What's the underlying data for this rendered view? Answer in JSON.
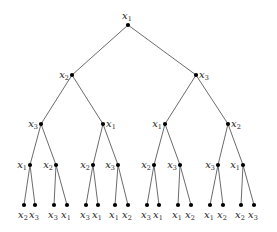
{
  "diagram": {
    "type": "tree",
    "variable_base": "x",
    "nodes": [
      {
        "id": "n0",
        "var": "1",
        "x": 128,
        "y": 25,
        "label_pos": "above"
      },
      {
        "id": "n1",
        "var": "2",
        "x": 72,
        "y": 75,
        "label_pos": "left"
      },
      {
        "id": "n2",
        "var": "3",
        "x": 196,
        "y": 75,
        "label_pos": "right"
      },
      {
        "id": "n3",
        "var": "3",
        "x": 41,
        "y": 124,
        "label_pos": "left"
      },
      {
        "id": "n4",
        "var": "1",
        "x": 103,
        "y": 124,
        "label_pos": "right"
      },
      {
        "id": "n5",
        "var": "1",
        "x": 165,
        "y": 124,
        "label_pos": "left"
      },
      {
        "id": "n6",
        "var": "2",
        "x": 228,
        "y": 124,
        "label_pos": "right"
      },
      {
        "id": "n7",
        "var": "1",
        "x": 30,
        "y": 165,
        "label_pos": "left"
      },
      {
        "id": "n8",
        "var": "2",
        "x": 56,
        "y": 165,
        "label_pos": "left"
      },
      {
        "id": "n9",
        "var": "2",
        "x": 93,
        "y": 165,
        "label_pos": "left"
      },
      {
        "id": "n10",
        "var": "3",
        "x": 118,
        "y": 165,
        "label_pos": "left"
      },
      {
        "id": "n11",
        "var": "2",
        "x": 154,
        "y": 165,
        "label_pos": "left"
      },
      {
        "id": "n12",
        "var": "3",
        "x": 180,
        "y": 165,
        "label_pos": "left"
      },
      {
        "id": "n13",
        "var": "3",
        "x": 218,
        "y": 165,
        "label_pos": "left"
      },
      {
        "id": "n14",
        "var": "1",
        "x": 243,
        "y": 165,
        "label_pos": "left"
      },
      {
        "id": "l0",
        "var": "2",
        "x": 24,
        "y": 205,
        "label_pos": "below"
      },
      {
        "id": "l1",
        "var": "3",
        "x": 35,
        "y": 205,
        "label_pos": "below"
      },
      {
        "id": "l2",
        "var": "3",
        "x": 54,
        "y": 205,
        "label_pos": "below"
      },
      {
        "id": "l3",
        "var": "1",
        "x": 67,
        "y": 205,
        "label_pos": "below"
      },
      {
        "id": "l4",
        "var": "3",
        "x": 86,
        "y": 205,
        "label_pos": "below"
      },
      {
        "id": "l5",
        "var": "1",
        "x": 98,
        "y": 205,
        "label_pos": "below"
      },
      {
        "id": "l6",
        "var": "1",
        "x": 115,
        "y": 205,
        "label_pos": "below"
      },
      {
        "id": "l7",
        "var": "2",
        "x": 128,
        "y": 205,
        "label_pos": "below"
      },
      {
        "id": "l8",
        "var": "3",
        "x": 147,
        "y": 205,
        "label_pos": "below"
      },
      {
        "id": "l9",
        "var": "1",
        "x": 159,
        "y": 205,
        "label_pos": "below"
      },
      {
        "id": "l10",
        "var": "1",
        "x": 178,
        "y": 205,
        "label_pos": "below"
      },
      {
        "id": "l11",
        "var": "2",
        "x": 191,
        "y": 205,
        "label_pos": "below"
      },
      {
        "id": "l12",
        "var": "1",
        "x": 210,
        "y": 205,
        "label_pos": "below"
      },
      {
        "id": "l13",
        "var": "2",
        "x": 223,
        "y": 205,
        "label_pos": "below"
      },
      {
        "id": "l14",
        "var": "2",
        "x": 241,
        "y": 205,
        "label_pos": "below"
      },
      {
        "id": "l15",
        "var": "3",
        "x": 254,
        "y": 205,
        "label_pos": "below"
      }
    ],
    "edges": [
      [
        "n0",
        "n1"
      ],
      [
        "n0",
        "n2"
      ],
      [
        "n1",
        "n3"
      ],
      [
        "n1",
        "n4"
      ],
      [
        "n2",
        "n5"
      ],
      [
        "n2",
        "n6"
      ],
      [
        "n3",
        "n7"
      ],
      [
        "n3",
        "n8"
      ],
      [
        "n4",
        "n9"
      ],
      [
        "n4",
        "n10"
      ],
      [
        "n5",
        "n11"
      ],
      [
        "n5",
        "n12"
      ],
      [
        "n6",
        "n13"
      ],
      [
        "n6",
        "n14"
      ],
      [
        "n7",
        "l0"
      ],
      [
        "n7",
        "l1"
      ],
      [
        "n8",
        "l2"
      ],
      [
        "n8",
        "l3"
      ],
      [
        "n9",
        "l4"
      ],
      [
        "n9",
        "l5"
      ],
      [
        "n10",
        "l6"
      ],
      [
        "n10",
        "l7"
      ],
      [
        "n11",
        "l8"
      ],
      [
        "n11",
        "l9"
      ],
      [
        "n12",
        "l10"
      ],
      [
        "n12",
        "l11"
      ],
      [
        "n13",
        "l12"
      ],
      [
        "n13",
        "l13"
      ],
      [
        "n14",
        "l14"
      ],
      [
        "n14",
        "l15"
      ]
    ],
    "levels": {
      "level_0": [
        "x1"
      ],
      "level_1": [
        "x2",
        "x3"
      ],
      "level_2": [
        "x3",
        "x1",
        "x1",
        "x2"
      ],
      "level_3": [
        "x1",
        "x2",
        "x2",
        "x3",
        "x2",
        "x3",
        "x3",
        "x1"
      ],
      "leaves": [
        "x2",
        "x3",
        "x3",
        "x1",
        "x3",
        "x1",
        "x1",
        "x2",
        "x3",
        "x1",
        "x1",
        "x2",
        "x1",
        "x2",
        "x2",
        "x3"
      ]
    },
    "colors": {
      "edge": "#5a5a5a",
      "node": "#000000",
      "label": "#222222",
      "background": "#ffffff"
    }
  }
}
